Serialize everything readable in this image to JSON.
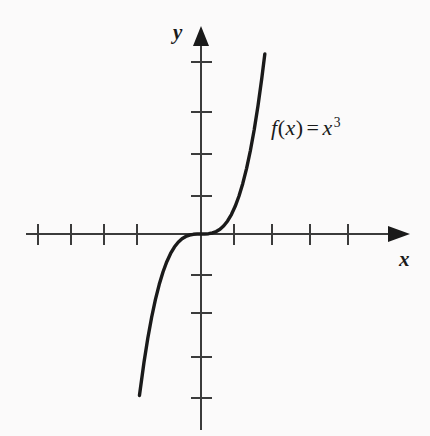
{
  "figure": {
    "kind": "cartesian-graph",
    "background_color": "#fbfafa",
    "ink_color": "#1a1a1a",
    "axis_color": "#444444"
  },
  "labels": {
    "y_axis": "y",
    "x_axis": "x",
    "function_f": "f",
    "function_open_paren": "(",
    "function_arg": "x",
    "function_close_paren": ")",
    "function_equals": "=",
    "function_base": "x",
    "function_exponent": "3",
    "function_full": "f(x) = x³"
  },
  "chart_data": {
    "type": "line",
    "title": "",
    "subtitle": "",
    "xlabel": "x",
    "ylabel": "y",
    "legend": [
      "f(x) = x³"
    ],
    "legend_position": "inside-upper-right",
    "grid": false,
    "annotations": [
      "f(x) = x³"
    ],
    "xlim": [
      -5.5,
      6.2
    ],
    "ylim": [
      -4.2,
      4.2
    ],
    "xticks": [
      -4,
      -3,
      -2,
      -1,
      1,
      2,
      3,
      4
    ],
    "yticks": [
      -4,
      -3,
      -2,
      -1,
      1,
      2,
      3,
      4
    ],
    "xtick_labels": [
      "",
      "",
      "",
      "",
      "",
      "",
      "",
      ""
    ],
    "ytick_labels": [
      "",
      "",
      "",
      "",
      "",
      "",
      "",
      ""
    ],
    "tick_labels_shown": false,
    "axis_arrows": [
      "x-positive",
      "y-positive"
    ],
    "series": [
      {
        "name": "f(x) = x³",
        "expression": "x^3",
        "color": "#1a1a1a",
        "linewidth": 3.4,
        "x": [
          -1.62,
          -1.5,
          -1.4,
          -1.3,
          -1.2,
          -1.1,
          -1.0,
          -0.9,
          -0.8,
          -0.7,
          -0.6,
          -0.5,
          -0.4,
          -0.3,
          -0.2,
          -0.1,
          0.0,
          0.1,
          0.2,
          0.3,
          0.4,
          0.5,
          0.6,
          0.7,
          0.8,
          0.9,
          1.0,
          1.1,
          1.2,
          1.3,
          1.4,
          1.5,
          1.6,
          1.68
        ],
        "y": [
          -4.25,
          -3.375,
          -2.744,
          -2.197,
          -1.728,
          -1.331,
          -1.0,
          -0.729,
          -0.512,
          -0.343,
          -0.216,
          -0.125,
          -0.064,
          -0.027,
          -0.008,
          -0.001,
          0.0,
          0.001,
          0.008,
          0.027,
          0.064,
          0.125,
          0.216,
          0.343,
          0.512,
          0.729,
          1.0,
          1.331,
          1.728,
          2.197,
          2.744,
          3.375,
          4.096,
          4.74
        ]
      }
    ]
  }
}
